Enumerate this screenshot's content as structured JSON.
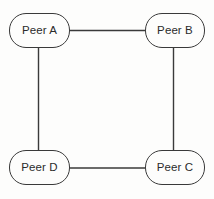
{
  "diagram": {
    "background_color": "#fdfdfc",
    "stroke_color": "#3a3a3a",
    "text_color": "#2b2b2b",
    "nodes": [
      {
        "id": "peer-a",
        "label": "Peer A",
        "shape": "rounded-rectangle"
      },
      {
        "id": "peer-b",
        "label": "Peer B",
        "shape": "rounded-rectangle"
      },
      {
        "id": "peer-c",
        "label": "Peer C",
        "shape": "rounded-rectangle"
      },
      {
        "id": "peer-d",
        "label": "Peer D",
        "shape": "rounded-rectangle"
      }
    ],
    "edges": [
      {
        "from": "peer-a",
        "to": "peer-b",
        "orientation": "horizontal"
      },
      {
        "from": "peer-b",
        "to": "peer-c",
        "orientation": "vertical"
      },
      {
        "from": "peer-d",
        "to": "peer-c",
        "orientation": "horizontal"
      },
      {
        "from": "peer-a",
        "to": "peer-d",
        "orientation": "vertical"
      }
    ]
  }
}
